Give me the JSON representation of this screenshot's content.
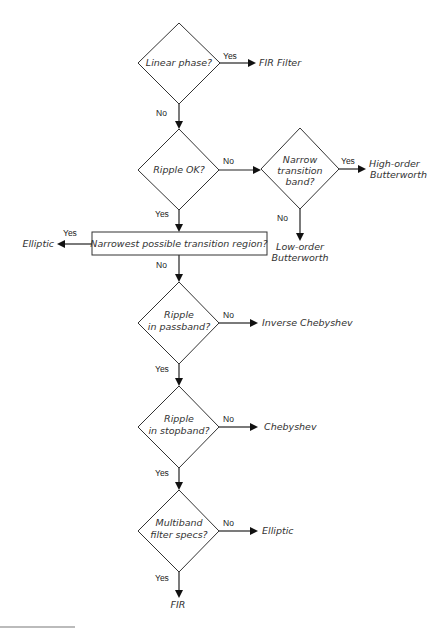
{
  "diagram": {
    "type": "flowchart",
    "nodes": {
      "linear_phase": {
        "kind": "decision",
        "lines": [
          "Linear phase?"
        ]
      },
      "fir_filter": {
        "kind": "terminal",
        "lines": [
          "FIR Filter"
        ]
      },
      "ripple_ok": {
        "kind": "decision",
        "lines": [
          "Ripple OK?"
        ]
      },
      "narrow_band": {
        "kind": "decision",
        "lines": [
          "Narrow",
          "transition",
          "band?"
        ]
      },
      "high_order": {
        "kind": "terminal",
        "lines": [
          "High-order",
          "Butterworth"
        ]
      },
      "low_order": {
        "kind": "terminal",
        "lines": [
          "Low-order",
          "Butterworth"
        ]
      },
      "narrowest_region": {
        "kind": "process",
        "lines": [
          "Narrowest possible transition region?"
        ]
      },
      "elliptic_1": {
        "kind": "terminal",
        "lines": [
          "Elliptic"
        ]
      },
      "ripple_passband": {
        "kind": "decision",
        "lines": [
          "Ripple",
          "in passband?"
        ]
      },
      "inverse_chebyshev": {
        "kind": "terminal",
        "lines": [
          "Inverse Chebyshev"
        ]
      },
      "ripple_stopband": {
        "kind": "decision",
        "lines": [
          "Ripple",
          "in stopband?"
        ]
      },
      "chebyshev": {
        "kind": "terminal",
        "lines": [
          "Chebyshev"
        ]
      },
      "multiband": {
        "kind": "decision",
        "lines": [
          "Multiband",
          "filter specs?"
        ]
      },
      "elliptic_2": {
        "kind": "terminal",
        "lines": [
          "Elliptic"
        ]
      },
      "fir": {
        "kind": "terminal",
        "lines": [
          "FIR"
        ]
      }
    },
    "edges": [
      {
        "from": "linear_phase",
        "to": "fir_filter",
        "label": "Yes"
      },
      {
        "from": "linear_phase",
        "to": "ripple_ok",
        "label": "No"
      },
      {
        "from": "ripple_ok",
        "to": "narrow_band",
        "label": "No"
      },
      {
        "from": "narrow_band",
        "to": "high_order",
        "label": "Yes"
      },
      {
        "from": "narrow_band",
        "to": "low_order",
        "label": "No"
      },
      {
        "from": "ripple_ok",
        "to": "narrowest_region",
        "label": "Yes"
      },
      {
        "from": "narrowest_region",
        "to": "elliptic_1",
        "label": "Yes"
      },
      {
        "from": "narrowest_region",
        "to": "ripple_passband",
        "label": "No"
      },
      {
        "from": "ripple_passband",
        "to": "inverse_chebyshev",
        "label": "No"
      },
      {
        "from": "ripple_passband",
        "to": "ripple_stopband",
        "label": "Yes"
      },
      {
        "from": "ripple_stopband",
        "to": "chebyshev",
        "label": "No"
      },
      {
        "from": "ripple_stopband",
        "to": "multiband",
        "label": "Yes"
      },
      {
        "from": "multiband",
        "to": "elliptic_2",
        "label": "No"
      },
      {
        "from": "multiband",
        "to": "fir",
        "label": "Yes"
      }
    ],
    "labels": {
      "yes": "Yes",
      "no": "No"
    },
    "colors": {
      "stroke": "#333333",
      "text": "#333333",
      "background": "#ffffff"
    }
  }
}
